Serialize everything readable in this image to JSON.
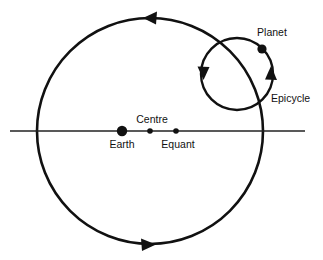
{
  "diagram": {
    "background_color": "#ffffff",
    "stroke_color": "#111111",
    "axis_color": "#222222",
    "width": 323,
    "height": 260,
    "labels": {
      "earth": "Earth",
      "centre": "Centre",
      "equant": "Equant",
      "planet": "Planet",
      "epicycle": "Epicycle"
    },
    "points": {
      "earth": {
        "x": 122,
        "y": 131,
        "r": 5.2
      },
      "centre": {
        "x": 150,
        "y": 131,
        "r": 2.8
      },
      "equant": {
        "x": 176,
        "y": 131,
        "r": 2.8
      },
      "planet": {
        "x": 262,
        "y": 49,
        "r": 4.6
      }
    },
    "label_positions": {
      "earth": {
        "x": 122,
        "y": 148
      },
      "centre": {
        "x": 152,
        "y": 123
      },
      "equant": {
        "x": 178,
        "y": 148
      },
      "planet": {
        "x": 272,
        "y": 36
      },
      "epicycle": {
        "x": 271,
        "y": 102
      }
    },
    "deferent": {
      "name": "deferent-circle",
      "cx": 150,
      "cy": 131,
      "r": 113,
      "direction": "counter-clockwise"
    },
    "epicycle_circle": {
      "name": "epicycle-circle",
      "cx": 237,
      "cy": 74,
      "r": 36,
      "direction": "counter-clockwise"
    },
    "axis_line": {
      "x1": 10,
      "y1": 131,
      "x2": 305,
      "y2": 131
    },
    "arrows": {
      "deferent_top": {
        "x": 152,
        "y": 18,
        "rotation": 180
      },
      "deferent_bottom": {
        "x": 147,
        "y": 244,
        "rotation": 0
      },
      "epicycle_left": {
        "x": 203,
        "y": 74,
        "rotation": 90
      },
      "epicycle_right": {
        "x": 271,
        "y": 74,
        "rotation": 270
      }
    }
  }
}
